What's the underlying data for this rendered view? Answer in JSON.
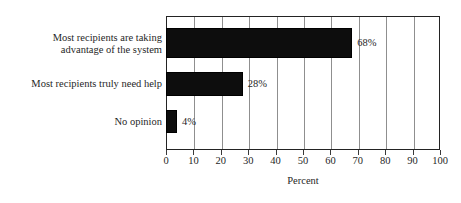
{
  "figure": {
    "cropped_title_remnant": "",
    "background_color": "#ffffff",
    "bar_color": "#0d0d0d",
    "frame_color": "#232323",
    "gridline_color": "#8f8f8f"
  },
  "chart_data": {
    "type": "bar",
    "orientation": "horizontal",
    "title": "",
    "xlabel": "Percent",
    "ylabel": "",
    "xlim": [
      0,
      100
    ],
    "xticks": [
      0,
      10,
      20,
      30,
      40,
      50,
      60,
      70,
      80,
      90,
      100
    ],
    "xtick_labels": [
      "0",
      "10",
      "20",
      "30",
      "40",
      "50",
      "60",
      "70",
      "80",
      "90",
      "100"
    ],
    "grid": true,
    "grid_axis": "x",
    "legend": false,
    "categories": [
      "Most recipients are taking\nadvantage of the system",
      "Most recipients truly need help",
      "No opinion"
    ],
    "values": [
      68,
      28,
      4
    ],
    "data_labels": [
      "68%",
      "28%",
      "4%"
    ]
  }
}
